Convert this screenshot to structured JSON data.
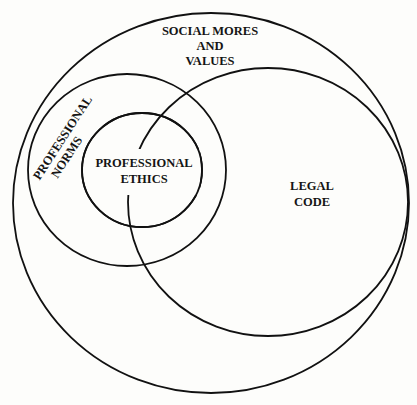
{
  "diagram": {
    "type": "nested-venn",
    "background": "#fdfdfb",
    "stroke_color": "#111111",
    "regions": {
      "social": {
        "label_lines": [
          "SOCIAL MORES",
          "AND",
          "VALUES"
        ],
        "shape": {
          "cx": 211,
          "cy": 203,
          "rx": 198,
          "ry": 190
        }
      },
      "legal": {
        "label_lines": [
          "LEGAL",
          "CODE"
        ],
        "shape": {
          "cx": 268,
          "cy": 202,
          "rx": 140,
          "ry": 134
        }
      },
      "norms": {
        "label_lines": [
          "PROFESSIONAL",
          "NORMS"
        ],
        "shape": {
          "cx": 127,
          "cy": 170,
          "rx": 99,
          "ry": 96
        }
      },
      "ethics": {
        "label_lines": [
          "PROFESSIONAL",
          "ETHICS"
        ],
        "shape": {
          "cx": 142,
          "cy": 170,
          "rx": 60,
          "ry": 57
        }
      }
    },
    "relationships": [
      "Professional Ethics is contained within Professional Norms",
      "Professional Norms is contained within Social Mores and Values",
      "Legal Code is contained within Social Mores and Values",
      "Legal Code overlaps Professional Norms and Professional Ethics"
    ]
  }
}
